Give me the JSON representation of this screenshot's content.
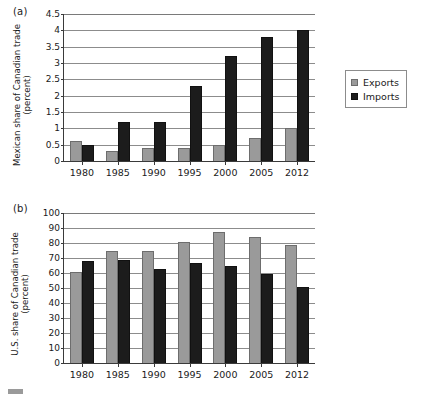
{
  "figure": {
    "legend_labels": [
      "Exports",
      "Imports"
    ],
    "colors": {
      "exports": "#9a9a9a",
      "imports": "#1c1c1c",
      "grid": "#8c8c8c",
      "axis": "#3a3a3a"
    }
  },
  "panel_a": {
    "label": "(a)",
    "ylabel": "Mexican share of Canadian trade (percent)"
  },
  "panel_b": {
    "label": "(b)",
    "ylabel": "U.S. share of Canadian trade (percent)"
  },
  "chart_data": [
    {
      "type": "bar",
      "title": "(a)",
      "categories": [
        "1980",
        "1985",
        "1990",
        "1995",
        "2000",
        "2005",
        "2012"
      ],
      "series": [
        {
          "name": "Exports",
          "values": [
            0.6,
            0.3,
            0.4,
            0.4,
            0.5,
            0.7,
            1.0
          ]
        },
        {
          "name": "Imports",
          "values": [
            0.5,
            1.2,
            1.2,
            2.3,
            3.2,
            3.8,
            4.0
          ]
        }
      ],
      "xlabel": "",
      "ylabel": "Mexican share of Canadian trade (percent)",
      "ylim": [
        0,
        4.5
      ],
      "yticks": [
        "0",
        "0.5",
        "1",
        "1.5",
        "2",
        "2.5",
        "3",
        "3.5",
        "4",
        "4.5"
      ],
      "ytick_values": [
        0,
        0.5,
        1,
        1.5,
        2,
        2.5,
        3,
        3.5,
        4,
        4.5
      ],
      "grid": true,
      "legend_position": "right"
    },
    {
      "type": "bar",
      "title": "(b)",
      "categories": [
        "1980",
        "1985",
        "1990",
        "1995",
        "2000",
        "2005",
        "2012"
      ],
      "series": [
        {
          "name": "Exports",
          "values": [
            61,
            75,
            75,
            80.5,
            87.5,
            84,
            79
          ]
        },
        {
          "name": "Imports",
          "values": [
            68,
            69,
            63,
            67,
            64.5,
            59.5,
            50.5
          ]
        }
      ],
      "xlabel": "",
      "ylabel": "U.S. share of Canadian trade (percent)",
      "ylim": [
        0,
        100
      ],
      "yticks": [
        "0",
        "10",
        "20",
        "30",
        "40",
        "50",
        "60",
        "70",
        "80",
        "90",
        "100"
      ],
      "ytick_values": [
        0,
        10,
        20,
        30,
        40,
        50,
        60,
        70,
        80,
        90,
        100
      ],
      "grid": true,
      "legend_position": "right"
    }
  ]
}
